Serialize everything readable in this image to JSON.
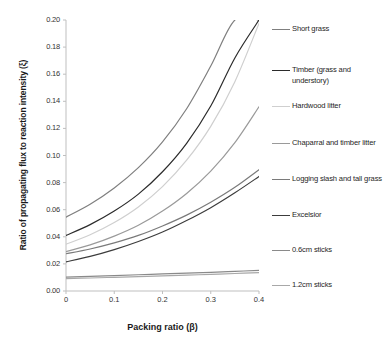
{
  "chart_data": {
    "type": "line",
    "title": "",
    "xlabel": "Packing ratio (β)",
    "ylabel": "Ratio of propagating flux to reaction intensity (ξ)",
    "xlim": [
      0,
      0.4
    ],
    "ylim": [
      0,
      0.2
    ],
    "xticks": [
      "0",
      "0.1",
      "0.2",
      "0.3",
      "0.4"
    ],
    "xtick_values": [
      0,
      0.1,
      0.2,
      0.3,
      0.4
    ],
    "yticks": [
      "0.00",
      "0.02",
      "0.04",
      "0.06",
      "0.08",
      "0.10",
      "0.12",
      "0.14",
      "0.16",
      "0.18",
      "0.20"
    ],
    "ytick_values": [
      0.0,
      0.02,
      0.04,
      0.06,
      0.08,
      0.1,
      0.12,
      0.14,
      0.16,
      0.18,
      0.2
    ],
    "grid": false,
    "legend_position": "right",
    "x": [
      0,
      0.05,
      0.1,
      0.15,
      0.2,
      0.25,
      0.3,
      0.35,
      0.4
    ],
    "series": [
      {
        "name": "Short grass",
        "color": "#7f7f7f",
        "values": [
          0.0545,
          0.064,
          0.076,
          0.091,
          0.11,
          0.1345,
          0.166,
          0.2,
          0.2
        ]
      },
      {
        "name": "Timber (grass and understory)",
        "color": "#2b2b2b",
        "values": [
          0.041,
          0.049,
          0.059,
          0.0715,
          0.088,
          0.109,
          0.1365,
          0.172,
          0.2
        ]
      },
      {
        "name": "Hardwood litter",
        "color": "#cfcfcf",
        "values": [
          0.0345,
          0.0415,
          0.0505,
          0.062,
          0.077,
          0.0965,
          0.1215,
          0.1545,
          0.1975
        ]
      },
      {
        "name": "Chaparral and timber litter",
        "color": "#9a9a9a",
        "values": [
          0.029,
          0.034,
          0.0405,
          0.0485,
          0.059,
          0.072,
          0.0885,
          0.1095,
          0.136
        ]
      },
      {
        "name": "Logging slash and tall grass",
        "color": "#7a7a7a",
        "values": [
          0.0275,
          0.031,
          0.0355,
          0.041,
          0.048,
          0.056,
          0.0655,
          0.0765,
          0.0895
        ]
      },
      {
        "name": "Excelsior",
        "color": "#3c3c3c",
        "values": [
          0.0215,
          0.0255,
          0.0305,
          0.0365,
          0.0435,
          0.052,
          0.0615,
          0.0725,
          0.0845
        ]
      },
      {
        "name": "0.6cm sticks",
        "color": "#8a8a8a",
        "values": [
          0.0103,
          0.0108,
          0.0114,
          0.012,
          0.0126,
          0.0132,
          0.0138,
          0.0145,
          0.0152
        ]
      },
      {
        "name": "1.2cm sticks",
        "color": "#a8a8a8",
        "values": [
          0.0092,
          0.0096,
          0.0101,
          0.0106,
          0.0111,
          0.0117,
          0.0123,
          0.0129,
          0.0136
        ]
      }
    ],
    "legend_entries": [
      {
        "label": "Short grass",
        "color": "#7f7f7f",
        "top": 10
      },
      {
        "label": "Timber (grass and understory)",
        "color": "#2b2b2b",
        "top": 51
      },
      {
        "label": "Hardwood litter",
        "color": "#cfcfcf",
        "top": 87
      },
      {
        "label": "Chaparral and timber litter",
        "color": "#9a9a9a",
        "top": 124
      },
      {
        "label": "Logging slash and tall grass",
        "color": "#7a7a7a",
        "top": 160
      },
      {
        "label": "Excelsior",
        "color": "#3c3c3c",
        "top": 196
      },
      {
        "label": "0.6cm sticks",
        "color": "#8a8a8a",
        "top": 231
      },
      {
        "label": "1.2cm sticks",
        "color": "#a8a8a8",
        "top": 266
      }
    ]
  }
}
